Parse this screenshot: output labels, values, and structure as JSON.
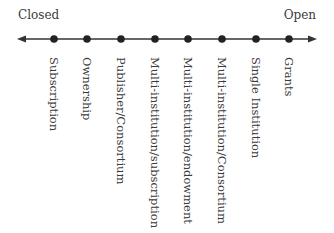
{
  "diagram": {
    "type": "spectrum",
    "left_label": "Closed",
    "right_label": "Open",
    "axis": {
      "y": 39,
      "x_start": 18,
      "x_end": 316,
      "color": "#333333"
    },
    "points": [
      {
        "label": "Subscription",
        "x": 54
      },
      {
        "label": "Ownership",
        "x": 87
      },
      {
        "label": "Publisher/Consortium",
        "x": 121
      },
      {
        "label": "Multi-institution/subscription",
        "x": 155
      },
      {
        "label": "Multi-institution/endowment",
        "x": 188
      },
      {
        "label": "Multi-institution/Consortium",
        "x": 222
      },
      {
        "label": "Single Institution",
        "x": 256
      },
      {
        "label": "Grants",
        "x": 289
      }
    ]
  }
}
